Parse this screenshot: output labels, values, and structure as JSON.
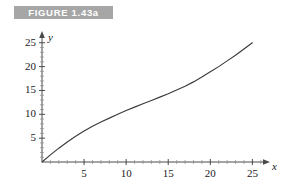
{
  "figure": {
    "label": "FIGURE 1.43a",
    "label_bg": "#a6a6a6",
    "label_fg": "#ffffff"
  },
  "chart_data": {
    "type": "line",
    "title": "FIGURE 1.43a",
    "xlabel": "x",
    "ylabel": "y",
    "xlim": [
      0,
      26.5
    ],
    "ylim": [
      0,
      26
    ],
    "grid": false,
    "legend": null,
    "axis_color": "#4a4a4a",
    "curve_color": "#3b3b3b",
    "xticks": [
      5,
      10,
      15,
      20,
      25
    ],
    "xtick_labels": [
      "5",
      "10",
      "15",
      "20",
      "25"
    ],
    "yticks": [
      5,
      10,
      15,
      20,
      25
    ],
    "ytick_labels": [
      "5",
      "10",
      "15",
      "20",
      "25"
    ],
    "x_minor_tick_step": 1,
    "y_minor_tick_step": 1,
    "series": [
      {
        "name": "curve",
        "x": [
          0,
          1,
          2,
          3,
          4,
          5,
          6,
          7,
          8,
          9,
          10,
          11,
          12,
          13,
          14,
          15,
          16,
          17,
          18,
          19,
          20,
          21,
          22,
          23,
          24,
          25
        ],
        "y": [
          0,
          1.5,
          2.9,
          4.2,
          5.4,
          6.5,
          7.5,
          8.4,
          9.2,
          10.0,
          10.8,
          11.5,
          12.2,
          12.9,
          13.6,
          14.3,
          15.1,
          15.9,
          16.8,
          17.8,
          18.9,
          20.0,
          21.2,
          22.4,
          23.7,
          25.0
        ]
      }
    ]
  }
}
